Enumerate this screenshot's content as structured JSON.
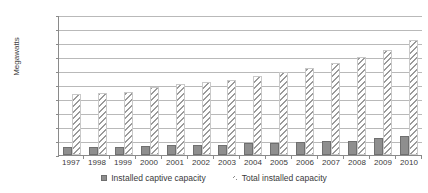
{
  "chart_data": {
    "type": "bar",
    "title": "",
    "xlabel": "",
    "ylabel": "Megawatts",
    "ylim": [
      0,
      200000
    ],
    "ytick_step": 20000,
    "yticks": [
      "200,000",
      "180,000",
      "160,000",
      "140,000",
      "120,000",
      "100,000",
      "80,000",
      "60,000",
      "40,000",
      "20,000",
      "0"
    ],
    "grid": true,
    "legend_position": "bottom-center",
    "categories": [
      "1997",
      "1998",
      "1999",
      "2000",
      "2001",
      "2002",
      "2003",
      "2004",
      "2005",
      "2006",
      "2007",
      "2008",
      "2009",
      "2010"
    ],
    "series": [
      {
        "name": "Installed captive capacity",
        "style": "solid-gray",
        "color": "#8e8e8e",
        "values": [
          11000,
          11500,
          12000,
          12500,
          14000,
          14500,
          15000,
          16500,
          17500,
          18500,
          20000,
          20500,
          24000,
          27000
        ]
      },
      {
        "name": "Total installed capacity",
        "style": "diagonal-hatch",
        "color": "#9a9a9a",
        "values": [
          87000,
          89000,
          90000,
          97000,
          101000,
          105000,
          107000,
          113000,
          118000,
          124000,
          132000,
          140000,
          150000,
          165000
        ]
      }
    ]
  },
  "legend": {
    "items": [
      {
        "label": "Installed captive capacity",
        "swatch": "solid-square-marker"
      },
      {
        "label": "Total installed capacity",
        "swatch": "hatch-square-marker"
      }
    ]
  }
}
